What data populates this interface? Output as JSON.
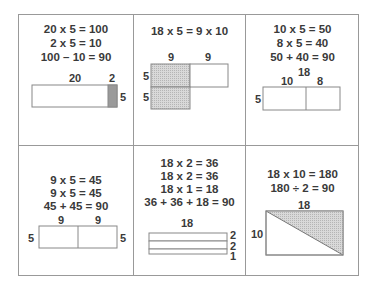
{
  "cells": [
    {
      "equations": [
        "20 x 5 = 100",
        "2 x 5 = 10",
        "100 – 10 = 90"
      ],
      "labels": {
        "top_left": "20",
        "top_right": "2",
        "right": "5"
      }
    },
    {
      "equations": [
        "18 x 5 = 9 x 10"
      ],
      "labels": {
        "top_left": "9",
        "top_right": "9",
        "left_top": "5",
        "left_bottom": "5"
      }
    },
    {
      "equations": [
        "10 x 5 = 50",
        "8 x 5 = 40",
        "50 + 40 = 90"
      ],
      "labels": {
        "total": "18",
        "top_left": "10",
        "top_right": "8",
        "left": "5"
      }
    },
    {
      "equations": [
        "9 x 5 = 45",
        "9 x 5 = 45",
        "45 + 45 = 90"
      ],
      "labels": {
        "top_left": "9",
        "top_right": "9",
        "left": "5",
        "right": "5"
      }
    },
    {
      "equations": [
        "18 x 2 = 36",
        "18 x 2 = 36",
        "18 x 1 = 18",
        "36 + 36 + 18 = 90"
      ],
      "labels": {
        "top": "18",
        "right_1": "2",
        "right_2": "2",
        "right_3": "1"
      }
    },
    {
      "equations": [
        "18 x 10 = 180",
        "180 ÷ 2 = 90"
      ],
      "labels": {
        "top": "18",
        "left": "10"
      }
    }
  ],
  "colors": {
    "border": "#999999",
    "shade": "#c8c8c8",
    "shade_dark": "#9a9a9a",
    "text": "#3a3a3a"
  }
}
